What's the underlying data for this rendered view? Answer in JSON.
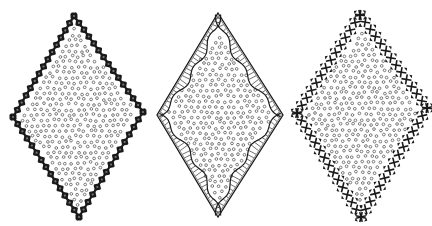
{
  "figure": {
    "panels": [
      {
        "id": "left",
        "border_style": "beaded-blocks",
        "fill_pattern": "small-circles",
        "stroke": "#1a1a1a"
      },
      {
        "id": "middle",
        "border_style": "thin-outline-with-scalloped-hatched-band",
        "fill_pattern": "small-circles",
        "stroke": "#1a1a1a"
      },
      {
        "id": "right",
        "border_style": "cross-stitch-triangles",
        "fill_pattern": "small-circles",
        "stroke": "#1a1a1a"
      }
    ],
    "colors": {
      "ink": "#1a1a1a",
      "dot": "#6a6a6a",
      "background": "#ffffff"
    }
  }
}
